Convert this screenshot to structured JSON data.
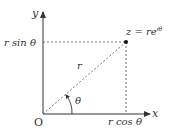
{
  "diagram": {
    "axes": {
      "x_label": "x",
      "y_label": "y",
      "origin_label": "O"
    },
    "point": {
      "label": "z = re",
      "exponent": "iθ"
    },
    "labels": {
      "r": "r",
      "theta": "θ",
      "r_sin": "r sin θ",
      "r_cos": "r cos θ"
    },
    "colors": {
      "ink": "#333333",
      "background": "#ffffff"
    }
  }
}
